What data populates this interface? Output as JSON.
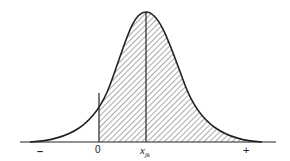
{
  "figure": {
    "type": "normal-distribution-curve",
    "shaded_region": "from 0 to +",
    "axis_labels": {
      "minus": "–",
      "zero": "0",
      "x_main": "x",
      "x_sub": "jk",
      "plus": "+"
    }
  }
}
